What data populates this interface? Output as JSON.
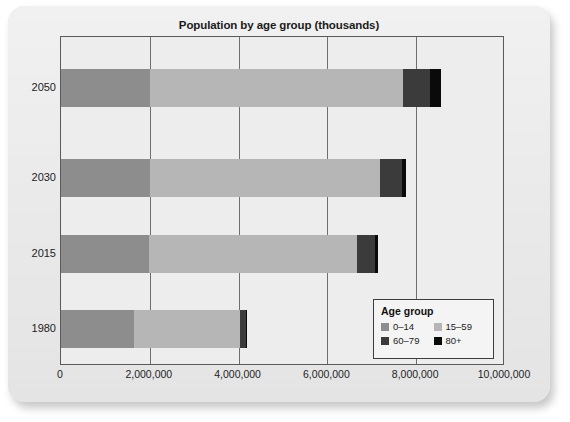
{
  "chart_data": {
    "type": "bar",
    "orientation": "horizontal",
    "stacked": true,
    "title": "Population by age group (thousands)",
    "xlabel": "",
    "ylabel": "",
    "categories": [
      "2050",
      "2030",
      "2015",
      "1980"
    ],
    "xlim": [
      0,
      10000000
    ],
    "xticks": [
      0,
      2000000,
      4000000,
      6000000,
      8000000,
      10000000
    ],
    "xtick_labels": [
      "0",
      "2,000,000",
      "4,000,000",
      "6,000,000",
      "8,000,000",
      "10,000,000"
    ],
    "grid": true,
    "legend_title": "Age group",
    "legend_position": "inside-bottom-right",
    "series": [
      {
        "name": "0–14",
        "color": "#8d8d8d",
        "values": [
          2000000,
          2000000,
          1980000,
          1640000
        ]
      },
      {
        "name": "15–59",
        "color": "#b6b6b6",
        "values": [
          5700000,
          5180000,
          4680000,
          2400000
        ]
      },
      {
        "name": "60–79",
        "color": "#3b3b3b",
        "values": [
          600000,
          500000,
          420000,
          130000
        ]
      },
      {
        "name": "80+",
        "color": "#0a0a0a",
        "values": [
          250000,
          80000,
          50000,
          20000
        ]
      }
    ],
    "totals": [
      8550000,
      7760000,
      7130000,
      4190000
    ]
  },
  "legend": {
    "title": "Age group",
    "items": [
      {
        "label": "0–14",
        "color": "#8d8d8d"
      },
      {
        "label": "15–59",
        "color": "#b6b6b6"
      },
      {
        "label": "60–79",
        "color": "#3b3b3b"
      },
      {
        "label": "80+",
        "color": "#0a0a0a"
      }
    ]
  }
}
